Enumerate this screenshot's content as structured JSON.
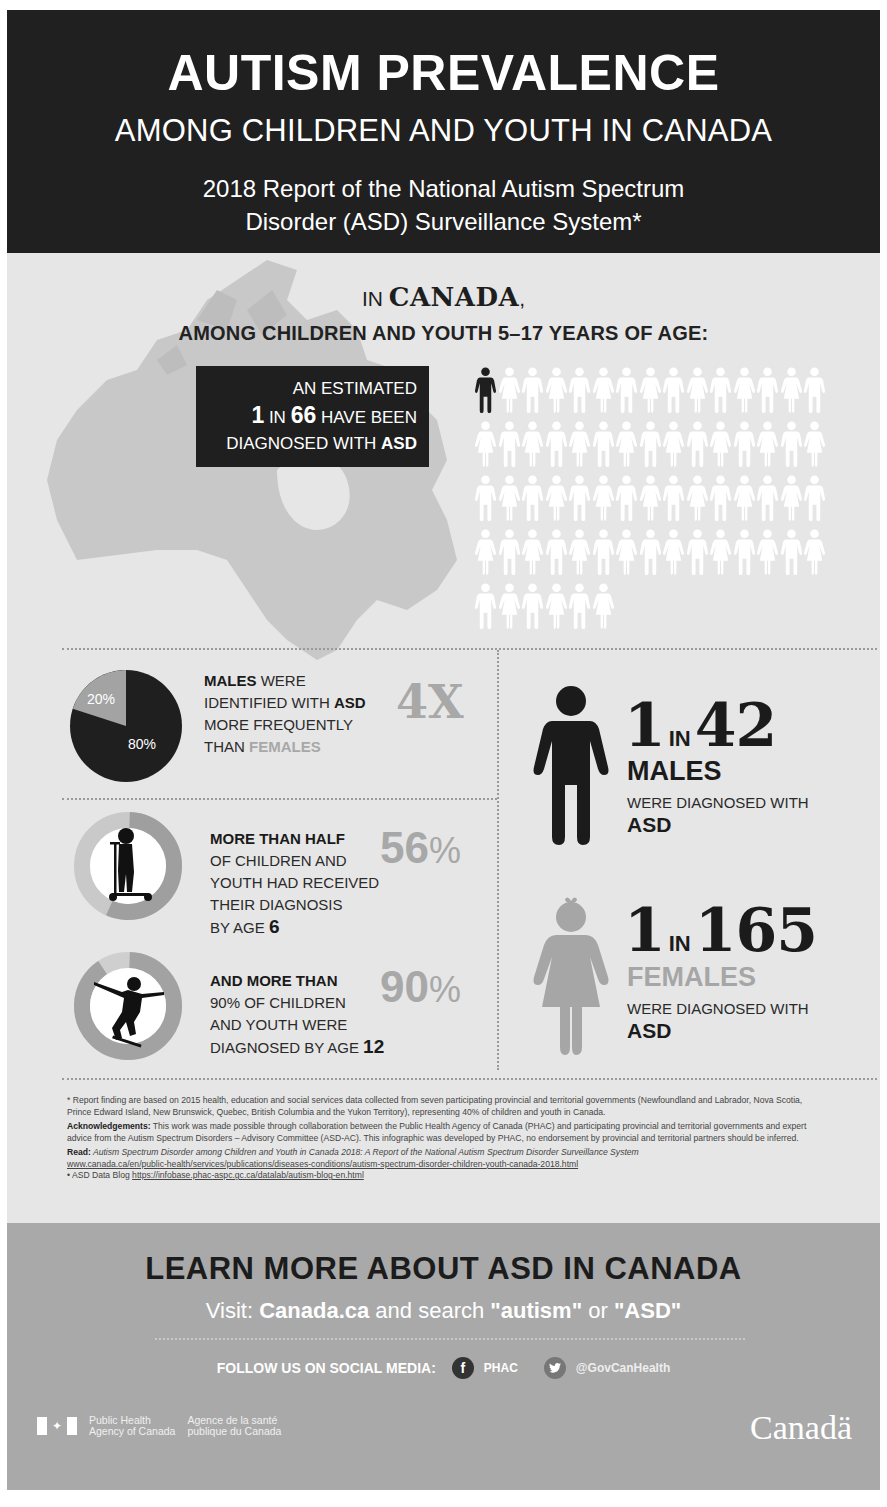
{
  "header": {
    "title": "AUTISM PREVALENCE",
    "subtitle": "AMONG CHILDREN AND YOUTH IN CANADA",
    "report_line1": "2018 Report of the National Autism Spectrum",
    "report_line2": "Disorder (ASD) Surveillance System*"
  },
  "intro": {
    "prefix": "IN ",
    "country": "CANADA",
    "suffix": ",",
    "age_line": "AMONG CHILDREN AND YOUTH 5–17 YEARS OF AGE:"
  },
  "estimate_box": {
    "line1": "AN ESTIMATED",
    "one": "1",
    "in": " IN ",
    "sixty_six": "66",
    "have_been": " HAVE BEEN",
    "line3_pre": "DIAGNOSED WITH ",
    "line3_asd": "ASD"
  },
  "pictogram": {
    "total": 66,
    "highlighted": 1,
    "rows": [
      15,
      15,
      15,
      15,
      6
    ],
    "highlight_color": "#1f1f1f",
    "base_color": "#ffffff"
  },
  "sex_ratio": {
    "pie_male_label": "80%",
    "pie_female_label": "20%",
    "text_bold1": "MALES",
    "text1": " WERE",
    "text2": "IDENTIFIED WITH ",
    "text2_bold": "ASD",
    "text3": "MORE FREQUENTLY",
    "text4": "THAN ",
    "text4_lite": "FEMALES",
    "big": "4X"
  },
  "by_age_6": {
    "headline": "MORE THAN HALF",
    "line2": "OF CHILDREN AND",
    "line3": "YOUTH HAD RECEIVED",
    "line4": "THEIR DIAGNOSIS",
    "line5": "BY AGE ",
    "age": "6",
    "big_num": "56",
    "big_pct": "%"
  },
  "by_age_12": {
    "headline": "AND MORE THAN",
    "line2": "90% OF CHILDREN",
    "line3": "AND YOUTH WERE",
    "line4": "DIAGNOSED BY AGE ",
    "age": "12",
    "big_num": "90",
    "big_pct": "%"
  },
  "males": {
    "one": "1",
    "in": "IN",
    "n": "42",
    "label": "MALES",
    "sub": "WERE DIAGNOSED WITH",
    "asd": "ASD"
  },
  "females": {
    "one": "1",
    "in": "IN",
    "n": "165",
    "label": "FEMALES",
    "sub": "WERE DIAGNOSED WITH",
    "asd": "ASD"
  },
  "notes": {
    "footnote": "* Report finding are based on 2015 health, education and social services data collected from seven participating provincial and territorial governments (Newfoundland and Labrador, Nova Scotia, Prince Edward Island, New Brunswick, Quebec, British Columbia and the Yukon Territory), representing 40% of children and youth in Canada.",
    "ack_label": "Acknowledgements:",
    "ack_text": " This work was made possible through collaboration between the Public Health Agency of Canada (PHAC) and participating provincial and territorial governments and expert advice from the Autism Spectrum Disorders – Advisory Committee (ASD-AC). This infographic was developed by PHAC, no endorsement by provincial and territorial partners should be inferred.",
    "read_label": "Read:",
    "read_title": " Autism Spectrum Disorder among Children and Youth in Canada 2018: A Report of the National Autism Spectrum Disorder Surveillance System",
    "read_url": "www.canada.ca/en/public-health/services/publications/diseases-conditions/autism-spectrum-disorder-children-youth-canada-2018.html",
    "blog_label": "• ASD Data Blog ",
    "blog_url": "https://infobase.phac-aspc.gc.ca/datalab/autism-blog-en.html"
  },
  "footer": {
    "learn": "LEARN MORE ABOUT ASD IN CANADA",
    "visit_pre": "Visit: ",
    "visit_site": "Canada.ca",
    "visit_mid": " and search ",
    "term1": "\"autism\"",
    "or": " or ",
    "term2": "\"ASD\"",
    "follow": "FOLLOW US ON SOCIAL MEDIA:",
    "fb_icon": "f",
    "fb_handle": "PHAC",
    "tw_icon": "•",
    "tw_handle": "@GovCanHealth",
    "agency_en1": "Public Health",
    "agency_en2": "Agency of Canada",
    "agency_fr1": "Agence de la santé",
    "agency_fr2": "publique du Canada",
    "wordmark": "Canadä",
    "maple": "✦"
  },
  "chart_data": [
    {
      "type": "pie",
      "title": "Males identified with ASD 4X more frequently than females",
      "categories": [
        "Males",
        "Females"
      ],
      "values": [
        80,
        20
      ],
      "labels": [
        "80%",
        "20%"
      ]
    },
    {
      "type": "pie",
      "title": "Diagnosed by age 6",
      "categories": [
        "Diagnosed by age 6",
        "Remainder"
      ],
      "values": [
        56,
        44
      ],
      "labels": [
        "56%"
      ]
    },
    {
      "type": "pie",
      "title": "Diagnosed by age 12",
      "categories": [
        "Diagnosed by age 12",
        "Remainder"
      ],
      "values": [
        90,
        10
      ],
      "labels": [
        "90%"
      ]
    },
    {
      "type": "table",
      "title": "Prevalence among children and youth 5–17 in Canada",
      "categories": [
        "Overall",
        "Males",
        "Females"
      ],
      "values": [
        "1 in 66",
        "1 in 42",
        "1 in 165"
      ]
    }
  ]
}
